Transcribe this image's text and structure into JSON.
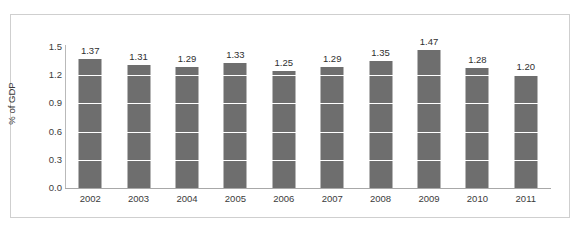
{
  "chart_data": {
    "type": "bar",
    "title": "",
    "subtitle": "",
    "xlabel": "",
    "ylabel": "% of GDP",
    "categories": [
      "2002",
      "2003",
      "2004",
      "2005",
      "2006",
      "2007",
      "2008",
      "2009",
      "2010",
      "2011"
    ],
    "values": [
      1.37,
      1.31,
      1.29,
      1.33,
      1.25,
      1.29,
      1.35,
      1.47,
      1.28,
      1.2
    ],
    "data_labels": [
      "1.37",
      "1.31",
      "1.29",
      "1.33",
      "1.25",
      "1.29",
      "1.35",
      "1.47",
      "1.28",
      "1.20"
    ],
    "ylim": [
      0.0,
      1.5
    ],
    "ytick_labels": [
      "1.5",
      "1.2",
      "0.9",
      "0.6",
      "0.3",
      "0.0"
    ],
    "ytick_values": [
      1.5,
      1.2,
      0.9,
      0.6,
      0.3,
      0.0
    ],
    "grid": true,
    "grid_orientation": "horizontal",
    "legend": null,
    "legend_position": "none",
    "series_color": "#6e6e6e",
    "gridline_color": "#ffffff",
    "axis_color": "#b9b9b9",
    "border_color": "#cfcfcf",
    "background_color": "#ffffff"
  }
}
